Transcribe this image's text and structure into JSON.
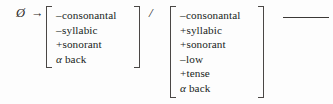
{
  "notation": {
    "type": "phonological-rule",
    "input_symbol": "Ø",
    "arrow": "→",
    "environment_separator": "/",
    "focus_bar": "___",
    "text_color": "#201d1c",
    "bracket_color": "#4a4745",
    "background_color": "#fdfdfd"
  },
  "target_matrix": {
    "name": "structural-change",
    "features": [
      {
        "value": "–",
        "name": "consonantal"
      },
      {
        "value": "–",
        "name": "syllabic"
      },
      {
        "value": "+",
        "name": "sonorant"
      },
      {
        "value": "α",
        "name": "back"
      }
    ]
  },
  "environment_matrix": {
    "name": "structural-description",
    "features": [
      {
        "value": "–",
        "name": "consonantal"
      },
      {
        "value": "+",
        "name": "syllabic"
      },
      {
        "value": "+",
        "name": "sonorant"
      },
      {
        "value": "–",
        "name": "low"
      },
      {
        "value": "+",
        "name": "tense"
      },
      {
        "value": "α",
        "name": "back"
      }
    ]
  }
}
